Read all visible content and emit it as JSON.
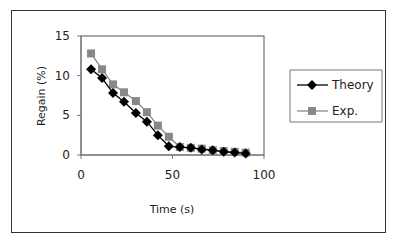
{
  "chart_data": {
    "type": "line",
    "title": "",
    "xlabel": "Time (s)",
    "ylabel": "Regain (%)",
    "xlim": [
      0,
      100
    ],
    "ylim": [
      0,
      15
    ],
    "xticks": [
      0,
      50,
      100
    ],
    "yticks": [
      0,
      5,
      10,
      15
    ],
    "grid": false,
    "legend_position": "right",
    "series": [
      {
        "name": "Theory",
        "marker": "diamond",
        "color": "#000000",
        "x": [
          5.5,
          11.5,
          17.5,
          23.5,
          30,
          36,
          42,
          48,
          54,
          60,
          66,
          72,
          78,
          84,
          90
        ],
        "y": [
          10.8,
          9.7,
          7.8,
          6.7,
          5.3,
          4.2,
          2.5,
          1.1,
          1.0,
          0.9,
          0.7,
          0.6,
          0.4,
          0.3,
          0.2
        ]
      },
      {
        "name": "Exp.",
        "marker": "square",
        "color": "#888888",
        "x": [
          5.5,
          11.5,
          17.5,
          23.5,
          30,
          36,
          42,
          48,
          54,
          60,
          66,
          72,
          78,
          84,
          90
        ],
        "y": [
          12.8,
          10.8,
          8.9,
          7.9,
          6.8,
          5.4,
          3.7,
          2.3,
          1.0,
          0.9,
          0.8,
          0.6,
          0.5,
          0.4,
          0.3
        ]
      }
    ]
  }
}
